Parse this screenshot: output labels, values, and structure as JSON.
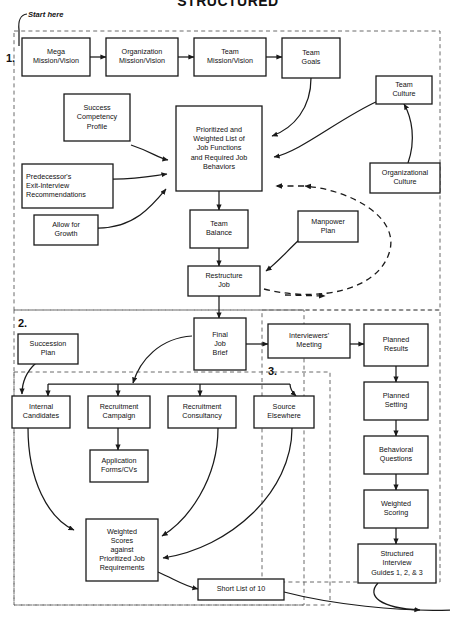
{
  "title": "STRUCTURED",
  "start_label": "Start here",
  "sections": [
    {
      "num": "1."
    },
    {
      "num": "2."
    },
    {
      "num": "3."
    }
  ],
  "nodes": {
    "mega_mission": "Mega|Mission/Vision",
    "org_mission": "Organization|Mission/Vision",
    "team_mission": "Team|Mission/Vision",
    "team_goals": "Team|Goals",
    "team_culture": "Team|Culture",
    "org_culture": "Organizational|Culture",
    "success_competency": "Success|Competency|Profile",
    "predecessor": "Predecessor's|Exit-Interview|Recommendations",
    "allow_growth": "Allow for|Growth",
    "prioritized_list": "Prioritized and|Weighted List of|Job Functions|and Required Job|Behaviors",
    "team_balance": "Team|Balance",
    "manpower_plan": "Manpower|Plan",
    "restructure_job": "Restructure|Job",
    "final_job_brief": "Final|Job|Brief",
    "succession_plan": "Succession|Plan",
    "internal_candidates": "Internal|Candidates",
    "recruitment_campaign": "Recruitment|Campaign",
    "recruitment_consultancy": "Recruitment|Consultancy",
    "source_elsewhere": "Source|Elsewhere",
    "application_forms": "Application|Forms/CVs",
    "weighted_scores": "Weighted|Scores|against|Prioritized Job|Requirements",
    "short_list": "Short List of 10",
    "interviewers_meeting": "Interviewers'|Meeting",
    "planned_results": "Planned|Results",
    "planned_setting": "Planned|Setting",
    "behavioral_questions": "Behavioral|Questions",
    "weighted_scoring": "Weighted|Scoring",
    "structured_interview": "Structured|Interview|Guides 1, 2, & 3"
  },
  "colors": {
    "box_stroke": "#1a1a1a",
    "box_fill": "#ffffff",
    "section_stroke": "#6b6b6b",
    "text": "#111111",
    "background": "#ffffff"
  }
}
